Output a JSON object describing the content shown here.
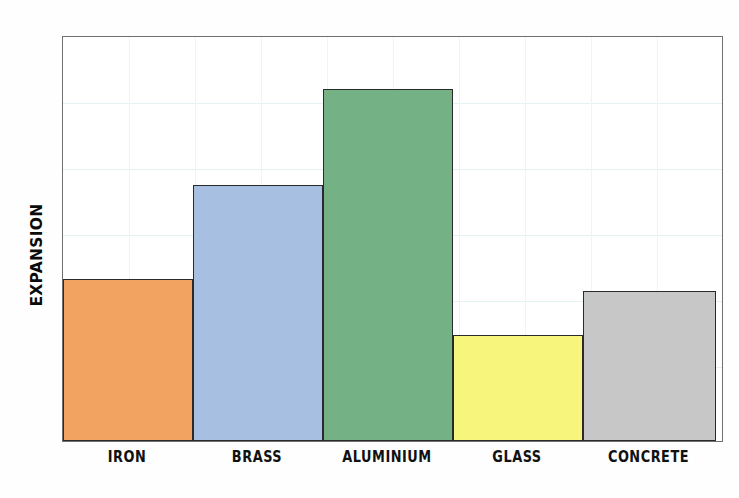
{
  "chart_data": {
    "type": "bar",
    "title": "",
    "subtitle": "",
    "xlabel": "",
    "ylabel": "EXPANSION",
    "categories": [
      "IRON",
      "BRASS",
      "ALUMINIUM",
      "GLASS",
      "CONCRETE"
    ],
    "values": [
      162,
      256,
      352,
      106,
      150
    ],
    "ylim": [
      0,
      406
    ],
    "grid": true,
    "legend": false,
    "legend_position": "none",
    "tick_labels_x": [
      "IRON",
      "BRASS",
      "ALUMINIUM",
      "GLASS",
      "CONCRETE"
    ],
    "tick_labels_y": [],
    "annotations": [],
    "bar_colors": [
      "#F2A261",
      "#A7C0E2",
      "#74B285",
      "#F8F57C",
      "#C7C7C7"
    ],
    "bar_edge_color": "#2a2a2a",
    "axis_color": "#6e7174",
    "grid_color": "#e3f2f2",
    "plot_background": "#FFFFFF",
    "figure_background": "#FEFEFE",
    "bars": [
      {
        "label": "IRON",
        "value": 162,
        "color": "#F2A261",
        "x_start": 0,
        "x_end": 130
      },
      {
        "label": "BRASS",
        "value": 256,
        "color": "#A7C0E2",
        "x_start": 130,
        "x_end": 260
      },
      {
        "label": "ALUMINIUM",
        "value": 352,
        "color": "#74B285",
        "x_start": 260,
        "x_end": 390
      },
      {
        "label": "GLASS",
        "value": 106,
        "color": "#F8F57C",
        "x_start": 390,
        "x_end": 520
      },
      {
        "label": "CONCRETE",
        "value": 150,
        "color": "#C7C7C7",
        "x_start": 520,
        "x_end": 653
      }
    ],
    "gridlines_horizontal": [
      66,
      132,
      198,
      264,
      330
    ],
    "gridlines_vertical": [
      66,
      132,
      198,
      264,
      330,
      396,
      462,
      528,
      594,
      660
    ]
  }
}
